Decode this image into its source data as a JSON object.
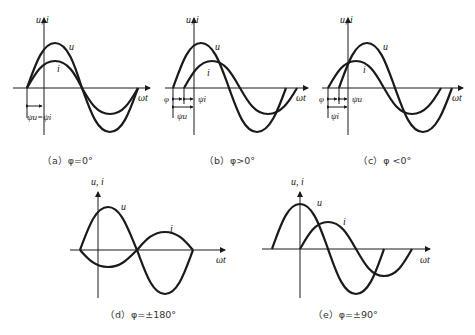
{
  "axis_labels": {
    "y": "u, i",
    "x": "ωt"
  },
  "curve_labels": {
    "voltage": "u",
    "current": "i"
  },
  "panels": [
    {
      "id": "a",
      "caption": "（a）φ=0°",
      "annotation": "ψu=ψi",
      "phase_labels": {
        "psi_u": "ψu",
        "psi_i": "ψi"
      }
    },
    {
      "id": "b",
      "caption": "（b）φ>0°",
      "annotations": [
        "φ",
        "ψi",
        "ψu"
      ]
    },
    {
      "id": "c",
      "caption": "（c）φ <0°",
      "annotations": [
        "φ",
        "ψu",
        "ψi"
      ]
    },
    {
      "id": "d",
      "caption": "（d）φ=±180°"
    },
    {
      "id": "e",
      "caption": "（e）φ=±90°"
    }
  ],
  "text": {
    "a_cap": "（a）φ=0°",
    "b_cap": "（b）φ>0°",
    "c_cap": "（c）φ <0°",
    "d_cap": "（d）φ=±180°",
    "e_cap": "（e）φ=±90°",
    "ui": "u, i",
    "wt": "ωt",
    "u": "u",
    "i": "i",
    "phi": "φ",
    "psi_u": "ψu",
    "psi_i": "ψi",
    "psi_eq": "ψu=ψi"
  }
}
